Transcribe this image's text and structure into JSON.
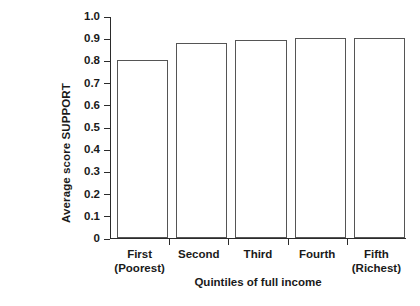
{
  "chart_data": {
    "type": "bar",
    "title": "",
    "categories": [
      "First\n(Poorest)",
      "Second",
      "Third",
      "Fourth",
      "Fifth\n(Richest)"
    ],
    "category_lines": [
      [
        "First",
        "(Poorest)"
      ],
      [
        "Second",
        ""
      ],
      [
        "Third",
        ""
      ],
      [
        "Fourth",
        ""
      ],
      [
        "Fifth",
        "(Richest)"
      ]
    ],
    "values": [
      0.8,
      0.88,
      0.89,
      0.9,
      0.9
    ],
    "xlabel": "Quintiles of full income",
    "ylabel": "Average score SUPPORT",
    "ylim": [
      0,
      1.0
    ],
    "yticks": [
      0,
      0.1,
      0.2,
      0.3,
      0.4,
      0.5,
      0.6,
      0.7,
      0.8,
      0.9,
      1.0
    ],
    "ytick_labels": [
      "0",
      "0.1",
      "0.2",
      "0.3",
      "0.4",
      "0.5",
      "0.6",
      "0.7",
      "0.8",
      "0.9",
      "1.0"
    ],
    "grid": false,
    "legend": null,
    "bar_fill_color": "#ffffff",
    "bar_edge_color": "#555555",
    "axis_color": "#2b2b2b",
    "background_color": "#ffffff"
  }
}
